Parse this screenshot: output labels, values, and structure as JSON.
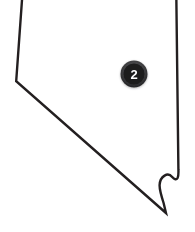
{
  "map": {
    "region_name": "Nevada",
    "shape_kind": "state-outline",
    "background_color": "#ffffff",
    "outline_color": "#231f20",
    "fill_color": "#ffffff",
    "outline_width_px": 2.4,
    "cropped_edges": [
      "top"
    ],
    "view_box": "0 0 195 232",
    "outline_path": "M 23.0 -14 L 16.2 81.2 L 166.0 213.0 L 163.6 203.0 C 160.8 194.4 159.4 189.2 159.6 185.0 C 159.8 180.6 161.6 177.4 164.6 175.6 C 167.4 173.9 170.2 174.6 172.2 177.0 C 174.4 179.6 176.4 180.0 177.6 178.0 C 178.4 176.6 178.6 174.2 178.4 169.4 L 176.2 -14 Z"
  },
  "markers": [
    {
      "id": "marker-2",
      "label": "2",
      "cx": 134,
      "cy": 74,
      "outer_radius": 13.5,
      "inner_radius": 10.5,
      "ring_color": "#3a3a3c",
      "fill_color": "#1b1b1d",
      "label_color": "#ffffff"
    }
  ]
}
